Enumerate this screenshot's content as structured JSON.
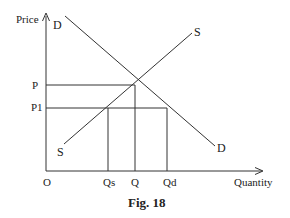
{
  "figure": {
    "caption": "Fig. 18",
    "type": "supply-demand price ceiling diagram"
  },
  "axes": {
    "y_label": "Price",
    "x_label": "Quantity",
    "origin_label": "O"
  },
  "price_labels": {
    "equilibrium": "P",
    "ceiling": "P1"
  },
  "quantity_labels": {
    "supplied": "Qs",
    "equilibrium": "Q",
    "demanded": "Qd"
  },
  "curves": {
    "demand": {
      "label_top": "D",
      "label_bottom": "D"
    },
    "supply": {
      "label_top": "S",
      "label_bottom": "S"
    }
  }
}
